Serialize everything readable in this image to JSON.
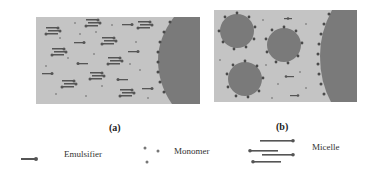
{
  "panels": {
    "a": {
      "caption": "(a)",
      "description": "Emulsifier and monomer dispersed in water near a monomer droplet"
    },
    "b": {
      "caption": "(b)",
      "description": "Micelles with surfactant shells dispersed near a monomer droplet"
    }
  },
  "legend": {
    "emulsifier": {
      "label": "Emulsifier",
      "icon": "emulsifier-icon"
    },
    "monomer": {
      "label": "Monomer",
      "icon": "monomer-icon"
    },
    "micelle": {
      "label": "Micelle",
      "icon": "micelle-icon"
    }
  },
  "colors": {
    "water": "#c4c4c4",
    "droplet": "#7a7a7a",
    "surfactant": "#4a4a4a",
    "background": "#ffffff"
  }
}
